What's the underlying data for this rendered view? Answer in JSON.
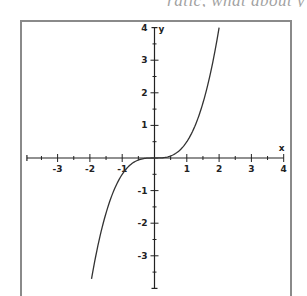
{
  "header_fragment": {
    "text": "ratic, what about y"
  },
  "chart_data": {
    "type": "line",
    "title": "",
    "function": "y = x^3 / 2",
    "xlabel": "x",
    "ylabel": "y",
    "xlim": [
      -4,
      4
    ],
    "ylim": [
      -4,
      4
    ],
    "grid": false,
    "legend": null,
    "x_ticks_major": [
      -3,
      -2,
      -1,
      1,
      2,
      3,
      4
    ],
    "x_ticks_minor_step": 0.5,
    "y_ticks_major": [
      -3,
      -2,
      -1,
      1,
      2,
      3,
      4
    ],
    "y_ticks_minor_step": 0.5,
    "x_tick_labels": [
      "-3",
      "-2",
      "-1",
      "1",
      "2",
      "3",
      "4"
    ],
    "y_tick_labels": [
      "-3",
      "-2",
      "-1",
      "1",
      "2",
      "3",
      "4"
    ],
    "series": [
      {
        "name": "curve",
        "x": [
          -1.95,
          -1.75,
          -1.5,
          -1.25,
          -1.0,
          -0.75,
          -0.5,
          -0.25,
          0,
          0.25,
          0.5,
          0.75,
          1.0,
          1.25,
          1.5,
          1.75,
          2.0
        ],
        "y": [
          -3.71,
          -2.68,
          -1.69,
          -0.98,
          -0.5,
          -0.21,
          -0.06,
          -0.01,
          0,
          0.01,
          0.06,
          0.21,
          0.5,
          0.98,
          1.69,
          2.68,
          4.0
        ]
      }
    ]
  },
  "layout": {
    "frame": {
      "left": 21,
      "top": 21,
      "right": 291,
      "bottom": 295
    },
    "origin_px": [
      154.5,
      158
    ],
    "px_per_unit_x": 32.3,
    "px_per_unit_y": 32.6,
    "colors": {
      "axis": "#222222",
      "curve": "#333333",
      "frame": "#888888"
    }
  }
}
